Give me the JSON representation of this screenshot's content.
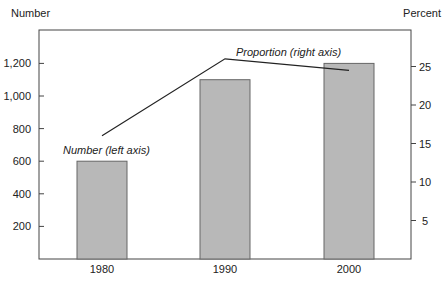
{
  "chart_data": {
    "type": "bar",
    "title": "",
    "categories": [
      "1980",
      "1990",
      "2000"
    ],
    "series": [
      {
        "name": "Number (left axis)",
        "type": "bar",
        "axis": "left",
        "values": [
          600,
          1100,
          1200
        ]
      },
      {
        "name": "Proportion (right axis)",
        "type": "line",
        "axis": "right",
        "values": [
          16,
          26,
          24.5
        ]
      }
    ],
    "left_axis": {
      "label": "Number",
      "ticks": [
        "200",
        "400",
        "600",
        "800",
        "1,000",
        "1,200"
      ],
      "tick_values": [
        200,
        400,
        600,
        800,
        1000,
        1200
      ],
      "ylim": [
        0,
        1400
      ]
    },
    "right_axis": {
      "label": "Percent",
      "ticks": [
        "5",
        "10",
        "15",
        "20",
        "25"
      ],
      "tick_values": [
        5,
        10,
        15,
        20,
        25
      ],
      "ylim": [
        0,
        29
      ]
    },
    "xlabel": "",
    "annotations": [
      "Number (left axis)",
      "Proportion (right axis)"
    ],
    "grid": false,
    "legend": "none (inline annotations)"
  },
  "colors": {
    "bar_fill": "#b8b8b8",
    "bar_stroke": "#666666",
    "axis": "#444444",
    "line": "#222222"
  }
}
